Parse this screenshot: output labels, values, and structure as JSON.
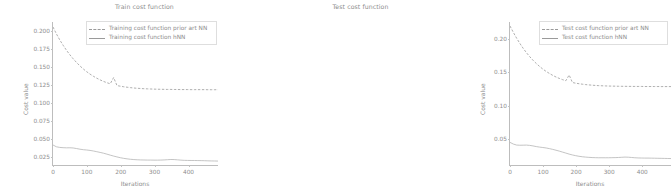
{
  "figure": {
    "width": 457,
    "height": 195,
    "background": "#ffffff",
    "line_color": "#9a9a9a",
    "text_color": "#8d8d8d",
    "axis_color": "#bdbdbd"
  },
  "panels": {
    "train": {
      "title": "Train cost function",
      "xlabel": "Iterations",
      "ylabel": "Cost value",
      "yticks": [
        "0.025",
        "0.050",
        "0.075",
        "0.100",
        "0.125",
        "0.150",
        "0.175",
        "0.200"
      ],
      "xticks": [
        "0",
        "100",
        "200",
        "300",
        "400"
      ],
      "legend": {
        "prior_art": "Training cost function prior art NN",
        "hnn": "Training cost function hNN"
      }
    },
    "test": {
      "title": "Test cost function",
      "xlabel": "Iterations",
      "ylabel": "Cost value",
      "yticks": [
        "0.05",
        "0.10",
        "0.15",
        "0.20"
      ],
      "xticks": [
        "0",
        "100",
        "200",
        "300",
        "400"
      ],
      "legend": {
        "prior_art": "Test cost function prior art NN",
        "hnn": "Test cost function hNN"
      }
    }
  },
  "chart_data": [
    {
      "type": "line",
      "title": "Train cost function",
      "xlabel": "Iterations",
      "ylabel": "Cost value",
      "xlim": [
        0,
        490
      ],
      "ylim": [
        0.012,
        0.212
      ],
      "grid": false,
      "legend_position": "upper right",
      "x": [
        0,
        10,
        20,
        30,
        40,
        50,
        60,
        70,
        80,
        90,
        100,
        110,
        120,
        130,
        140,
        150,
        160,
        170,
        180,
        190,
        200,
        210,
        220,
        230,
        240,
        250,
        260,
        270,
        280,
        290,
        300,
        310,
        320,
        330,
        340,
        350,
        360,
        370,
        380,
        390,
        400,
        410,
        420,
        430,
        440,
        450,
        460,
        470,
        480,
        490
      ],
      "series": [
        {
          "name": "Training cost function prior art NN",
          "style": "dashed",
          "color": "#9a9a9a",
          "values": [
            0.205,
            0.1955,
            0.187,
            0.1795,
            0.1725,
            0.1662,
            0.1605,
            0.1553,
            0.1506,
            0.1463,
            0.1425,
            0.1391,
            0.1361,
            0.1334,
            0.131,
            0.1289,
            0.1271,
            0.1256,
            0.1343,
            0.1231,
            0.1222,
            0.1214,
            0.1208,
            0.1202,
            0.1197,
            0.1193,
            0.119,
            0.1187,
            0.1185,
            0.1183,
            0.1181,
            0.118,
            0.1179,
            0.1178,
            0.1177,
            0.1177,
            0.1176,
            0.1176,
            0.1175,
            0.1175,
            0.1175,
            0.1174,
            0.1174,
            0.1174,
            0.1174,
            0.1174,
            0.1173,
            0.1173,
            0.1173,
            0.1173
          ]
        },
        {
          "name": "Training cost function hNN",
          "style": "solid",
          "color": "#b5b5b5",
          "values": [
            0.04,
            0.0375,
            0.0366,
            0.0362,
            0.036,
            0.0361,
            0.0358,
            0.035,
            0.0341,
            0.0334,
            0.033,
            0.0324,
            0.0316,
            0.0306,
            0.0296,
            0.0285,
            0.0272,
            0.0258,
            0.0245,
            0.0233,
            0.0222,
            0.0213,
            0.0206,
            0.02,
            0.0196,
            0.0193,
            0.0191,
            0.019,
            0.0189,
            0.0189,
            0.0188,
            0.0188,
            0.0189,
            0.0191,
            0.0194,
            0.0197,
            0.0196,
            0.0192,
            0.0188,
            0.0185,
            0.0184,
            0.0183,
            0.0183,
            0.0182,
            0.0181,
            0.018,
            0.0178,
            0.0177,
            0.0176,
            0.0175
          ]
        }
      ]
    },
    {
      "type": "line",
      "title": "Test cost function",
      "xlabel": "Iterations",
      "ylabel": "Cost value",
      "xlim": [
        0,
        490
      ],
      "ylim": [
        0.01,
        0.225
      ],
      "grid": false,
      "legend_position": "upper right",
      "x": [
        0,
        10,
        20,
        30,
        40,
        50,
        60,
        70,
        80,
        90,
        100,
        110,
        120,
        130,
        140,
        150,
        160,
        170,
        180,
        190,
        200,
        210,
        220,
        230,
        240,
        250,
        260,
        270,
        280,
        290,
        300,
        310,
        320,
        330,
        340,
        350,
        360,
        370,
        380,
        390,
        400,
        410,
        420,
        430,
        440,
        450,
        460,
        470,
        480,
        490
      ],
      "series": [
        {
          "name": "Test cost function prior art NN",
          "style": "dashed",
          "color": "#9a9a9a",
          "values": [
            0.219,
            0.2095,
            0.2008,
            0.1928,
            0.1855,
            0.1789,
            0.1729,
            0.1675,
            0.1626,
            0.1582,
            0.1542,
            0.1507,
            0.1476,
            0.1448,
            0.1423,
            0.1402,
            0.1383,
            0.1367,
            0.1453,
            0.134,
            0.133,
            0.1322,
            0.1315,
            0.1309,
            0.1304,
            0.13,
            0.1296,
            0.1293,
            0.1291,
            0.1289,
            0.1287,
            0.1286,
            0.1285,
            0.1284,
            0.1283,
            0.1283,
            0.1282,
            0.1282,
            0.1281,
            0.1281,
            0.1281,
            0.128,
            0.128,
            0.128,
            0.128,
            0.128,
            0.1279,
            0.1279,
            0.1279,
            0.1279
          ]
        },
        {
          "name": "Test cost function hNN",
          "style": "solid",
          "color": "#b5b5b5",
          "values": [
            0.044,
            0.0415,
            0.04,
            0.0397,
            0.0398,
            0.0399,
            0.0395,
            0.0387,
            0.0377,
            0.0369,
            0.0363,
            0.0356,
            0.0346,
            0.0335,
            0.0322,
            0.0309,
            0.0294,
            0.0279,
            0.0264,
            0.0251,
            0.024,
            0.0231,
            0.0224,
            0.0219,
            0.0215,
            0.0212,
            0.021,
            0.0209,
            0.0209,
            0.0209,
            0.0209,
            0.021,
            0.0211,
            0.0213,
            0.0216,
            0.0219,
            0.0217,
            0.0213,
            0.0209,
            0.0206,
            0.0205,
            0.0204,
            0.0204,
            0.0203,
            0.0202,
            0.0201,
            0.02,
            0.0199,
            0.0198,
            0.0197
          ]
        }
      ]
    }
  ]
}
